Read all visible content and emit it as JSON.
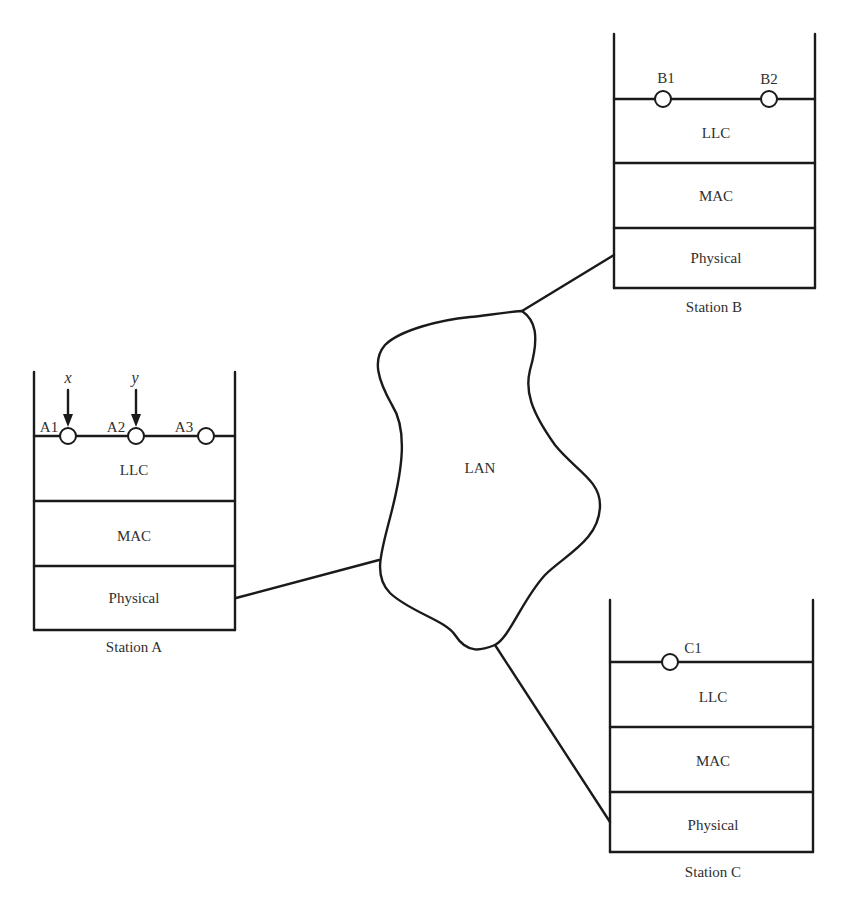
{
  "diagram": {
    "lan": {
      "label": "LAN"
    },
    "stations": [
      {
        "id": "A",
        "name": "Station A",
        "layers": [
          "LLC",
          "MAC",
          "Physical"
        ],
        "saps": [
          "A1",
          "A2",
          "A3"
        ],
        "users": [
          {
            "label": "x",
            "sap": "A1"
          },
          {
            "label": "y",
            "sap": "A2"
          }
        ]
      },
      {
        "id": "B",
        "name": "Station B",
        "layers": [
          "LLC",
          "MAC",
          "Physical"
        ],
        "saps": [
          "B1",
          "B2"
        ]
      },
      {
        "id": "C",
        "name": "Station C",
        "layers": [
          "LLC",
          "MAC",
          "Physical"
        ],
        "saps": [
          "C1"
        ]
      }
    ],
    "links": [
      {
        "from": "Station A Physical",
        "to": "LAN"
      },
      {
        "from": "Station B Physical",
        "to": "LAN"
      },
      {
        "from": "Station C Physical",
        "to": "LAN"
      }
    ],
    "colors": {
      "line": "#1a1a1a",
      "text": "#2f2f2f",
      "background": "#ffffff"
    }
  }
}
